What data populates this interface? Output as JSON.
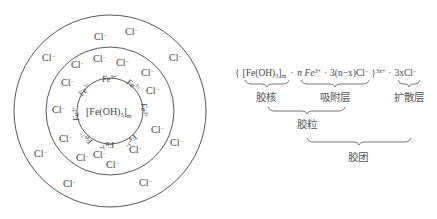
{
  "micelle_diagram": {
    "core_label": "[Fe(OH)3]m",
    "core_text": "[Fe(OH)",
    "core_sub": "3",
    "core_bracket": "]",
    "core_m": "m",
    "adsorbed_ion": "Fe",
    "adsorbed_ion_charge": "3+",
    "counter_ion": "Cl",
    "counter_ion_charge": "−",
    "circles": {
      "inner_radius": 33,
      "middle_radius": 64,
      "outer_radius": 96
    }
  },
  "formula": {
    "open_bracket": "{",
    "core": "[Fe(OH)",
    "core_sub": "3",
    "core_close": "]",
    "core_m": "m",
    "dot1": "·",
    "n_fe": "n Fe",
    "fe_charge": "3+",
    "dot2": "·",
    "cl_part": "3(n−x)Cl",
    "cl_charge": "−",
    "close_bracket": "}",
    "outer_charge": "3x+",
    "dot3": "·",
    "diffuse": "3xCl",
    "diffuse_charge": "−"
  },
  "labels": {
    "nucleus": "胶核",
    "adsorption_layer": "吸附层",
    "diffuse_layer": "扩散层",
    "colloidal_particle": "胶粒",
    "micelle": "胶团"
  }
}
